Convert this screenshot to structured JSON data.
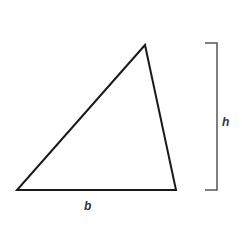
{
  "diagram": {
    "type": "triangle-area",
    "triangle": {
      "vertices": [
        [
          17,
          190
        ],
        [
          176,
          190
        ],
        [
          145,
          45
        ]
      ],
      "stroke_color": "#1a1a1a"
    },
    "height_bracket": {
      "x_left": 205,
      "x_right": 217,
      "y_top": 43,
      "y_bottom": 190,
      "color": "#555555"
    },
    "labels": {
      "base": "b",
      "height": "h"
    }
  }
}
